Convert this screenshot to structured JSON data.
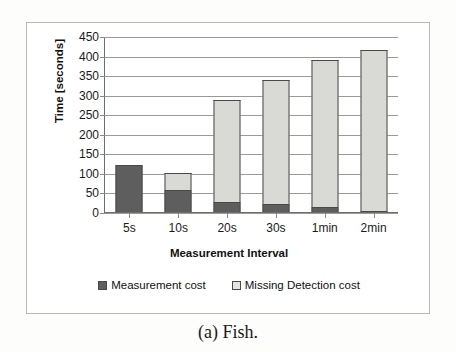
{
  "caption": "(a) Fish.",
  "chart_data": {
    "type": "bar",
    "subtype": "stacked-bar",
    "title": "",
    "xlabel": "Measurement Interval",
    "ylabel": "Time [seconds]",
    "categories": [
      "5s",
      "10s",
      "20s",
      "30s",
      "1min",
      "2min"
    ],
    "series": [
      {
        "name": "Measurement cost",
        "color": "#5e5e5e",
        "values": [
          122,
          58,
          28,
          22,
          15,
          5
        ]
      },
      {
        "name": "Missing Detection cost",
        "color": "#d9d9d6",
        "values": [
          0,
          45,
          262,
          318,
          376,
          411
        ]
      }
    ],
    "totals": [
      122,
      103,
      290,
      340,
      391,
      416
    ],
    "ylim": [
      0,
      450
    ],
    "ytick_values": [
      0,
      50,
      100,
      150,
      200,
      250,
      300,
      350,
      400,
      450
    ],
    "ytick_labels": [
      "0",
      "50",
      "100",
      "150",
      "200",
      "250",
      "300",
      "350",
      "400",
      "450"
    ],
    "grid": true,
    "grid_axis": "y",
    "legend_position": "bottom",
    "legend": [
      "Measurement cost",
      "Missing Detection cost"
    ]
  }
}
